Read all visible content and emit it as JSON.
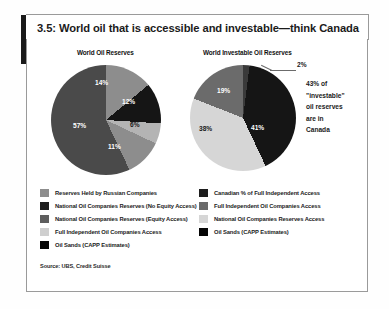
{
  "figure": {
    "number": "3.5",
    "title": "3.5: World oil that is accessible and investable—think Canada",
    "source": "Source: UBS, Credit Suisse"
  },
  "callout": {
    "line1": "43% of",
    "line2": "\"investable\"",
    "line3": "oil reserves",
    "line4": "are in",
    "line5": "Canada"
  },
  "colors": {
    "mid_gray": "#8d8d8d",
    "near_black": "#151515",
    "dark_gray": "#5e5e5e",
    "light_gray": "#cfcfcf",
    "black": "#000000",
    "frame": "#9a9a9a"
  },
  "legend_left": {
    "items": [
      {
        "label": "Reserves Held by Russian Companies",
        "color": "#8d8d8d"
      },
      {
        "label": "National Oil Companies Reserves (No Equity Access)",
        "color": "#1d1d1d"
      },
      {
        "label": "National Oil Companies Reserves (Equity Access)",
        "color": "#5e5e5e"
      },
      {
        "label": "Full Independent Oil Companies Access",
        "color": "#cfcfcf"
      },
      {
        "label": "Oil Sands (CAPP Estimates)",
        "color": "#050505"
      }
    ]
  },
  "legend_right": {
    "items": [
      {
        "label": "Canadian % of Full Independent Access",
        "color": "#1d1d1d"
      },
      {
        "label": "Full Independent Oil Companies Access",
        "color": "#6b6b6b"
      },
      {
        "label": "National Oil Companies Reserves Access",
        "color": "#d6d6d6"
      },
      {
        "label": "Oil Sands (CAPP Estimates)",
        "color": "#050505"
      }
    ]
  },
  "chart_data": [
    {
      "type": "pie",
      "title": "World Oil Reserves",
      "categories": [
        "Reserves Held by Russian Companies",
        "National Oil Companies Reserves (No Equity Access)",
        "National Oil Companies Reserves (Equity Access)",
        "Full Independent Oil Companies Access",
        "Oil Sands (CAPP Estimates)"
      ],
      "values": [
        14,
        12,
        6,
        11,
        57
      ],
      "labels": [
        "14%",
        "12%",
        "6%",
        "11%",
        "57%"
      ],
      "colors": [
        "#8d8d8d",
        "#151515",
        "#b4b4b4",
        "#8d8d8d",
        "#4a4a4a"
      ],
      "legend_position": "bottom-left",
      "units": "percent"
    },
    {
      "type": "pie",
      "title": "World Investable Oil Reserves",
      "categories": [
        "Canadian % of Full Independent Access",
        "Full Independent Oil Companies Access",
        "National Oil Companies Reserves Access",
        "Oil Sands (CAPP Estimates)"
      ],
      "values": [
        2,
        19,
        38,
        41
      ],
      "labels": [
        "2%",
        "19%",
        "38%",
        "41%"
      ],
      "colors": [
        "#3a3a3a",
        "#6b6b6b",
        "#d6d6d6",
        "#151515"
      ],
      "legend_position": "bottom-right",
      "annotation": "43% of \"investable\" oil reserves are in Canada",
      "units": "percent"
    }
  ]
}
